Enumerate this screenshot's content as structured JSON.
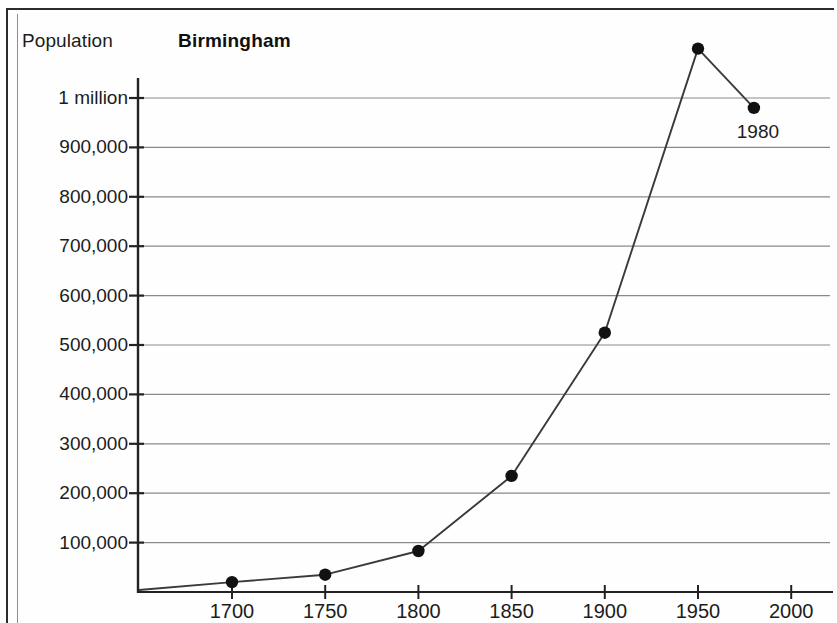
{
  "figure": {
    "axis_title": "Population",
    "title": "Birmingham"
  },
  "annotations": [
    {
      "label": "1980",
      "x": 1980,
      "y": 980000
    }
  ],
  "chart_data": {
    "type": "line",
    "title": "Birmingham",
    "xlabel": "",
    "ylabel": "Population",
    "x": [
      1700,
      1750,
      1800,
      1850,
      1900,
      1950,
      1980
    ],
    "values": [
      20000,
      35000,
      83000,
      235000,
      525000,
      1100000,
      980000
    ],
    "series": [
      {
        "name": "Birmingham",
        "values": [
          20000,
          35000,
          83000,
          235000,
          525000,
          1100000,
          980000
        ]
      }
    ],
    "xlim": [
      1660,
      2020
    ],
    "ylim": [
      0,
      1200000
    ],
    "xticks": [
      1700,
      1750,
      1800,
      1850,
      1900,
      1950,
      2000
    ],
    "xtick_labels": [
      "1700",
      "1750",
      "1800",
      "1850",
      "1900",
      "1950",
      "2000"
    ],
    "yticks": [
      100000,
      200000,
      300000,
      400000,
      500000,
      600000,
      700000,
      800000,
      900000,
      1000000
    ],
    "ytick_labels": [
      "100,000",
      "200,000",
      "300,000",
      "400,000",
      "500,000",
      "600,000",
      "700,000",
      "800,000",
      "900,000",
      "1 million"
    ],
    "grid": true,
    "grid_axis": "y",
    "legend": "none",
    "marker": "filled-circle",
    "annotations": [
      {
        "text": "1980",
        "x": 1980,
        "y": 980000
      }
    ],
    "colors": {
      "line": "#3a3a3a",
      "marker": "#111111",
      "grid": "#8a8a8a",
      "axis": "#222222",
      "text": "#1c1c1c",
      "background": "#fefefe"
    }
  }
}
